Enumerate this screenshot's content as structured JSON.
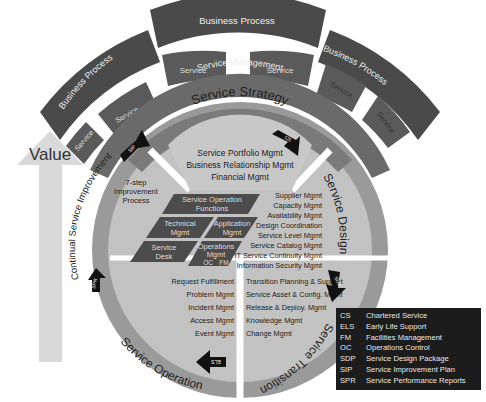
{
  "outer_ring": {
    "business_processes": [
      "Business Process",
      "Business Process",
      "Business Process"
    ],
    "services": [
      "Service",
      "Service",
      "Service",
      "Service",
      "Service",
      "Service",
      "Service"
    ],
    "service_management": "Service Management"
  },
  "value_arrow": {
    "label": "Value"
  },
  "lifecycle": {
    "strategy": {
      "title": "Service Strategy",
      "items": [
        "Service Portfolio Mgmt",
        "Business Relationship Mgmt",
        "Financial Mgmt"
      ]
    },
    "design": {
      "title": "Service Design",
      "items": [
        "Supplier Mgmt",
        "Capacity Mgmt",
        "Availability Mgmt",
        "Design Coordination",
        "Service Level Mgmt",
        "Service Catalog Mgmt",
        "IT Service Continuity Mgmt",
        "Information Security Mgmt"
      ]
    },
    "transition": {
      "title": "Service Transition",
      "items": [
        "Transition Planning & Support",
        "Service Asset & Config. Mgmt",
        "Release & Deploy. Mgmt",
        "Knowledge Mgmt",
        "Change Mgmt"
      ]
    },
    "operation": {
      "title": "Service Operation",
      "items": [
        "Request Fulfillment",
        "Problem Mgmt",
        "Incident Mgmt",
        "Access Mgmt",
        "Event Mgmt"
      ]
    },
    "csi": {
      "title": "Continual Service Improvement",
      "process": [
        "7-step",
        "Improvement",
        "Process"
      ]
    }
  },
  "functions": {
    "header": [
      "Service Operation",
      "Functions"
    ],
    "technical": [
      "Technical",
      "Mgmt"
    ],
    "application": [
      "Application",
      "Mgmt"
    ],
    "service_desk": [
      "Service",
      "Desk"
    ],
    "operations": [
      "Operations",
      "Mgmt"
    ],
    "ops_sub": [
      "OC",
      "FM"
    ]
  },
  "arrows": {
    "cs": "CS",
    "sdp": "SDP",
    "els": "ELS",
    "spr": "SPR",
    "sip": "SIP"
  },
  "legend": [
    {
      "abbr": "CS",
      "text": "Chartered Service"
    },
    {
      "abbr": "ELS",
      "text": "Early Life Support"
    },
    {
      "abbr": "FM",
      "text": "Facilities Management"
    },
    {
      "abbr": "OC",
      "text": "Operations Control"
    },
    {
      "abbr": "SDP",
      "text": "Service Design Package"
    },
    {
      "abbr": "SIP",
      "text": "Service Improvement Plan"
    },
    {
      "abbr": "SPR",
      "text": "Service Performance Reports"
    }
  ],
  "colors": {
    "dark": "#444444",
    "mid": "#6a6a6a",
    "ring": "#9a9a9a",
    "light": "#bdbdbd",
    "value_arrow": "#d8d8d8"
  }
}
